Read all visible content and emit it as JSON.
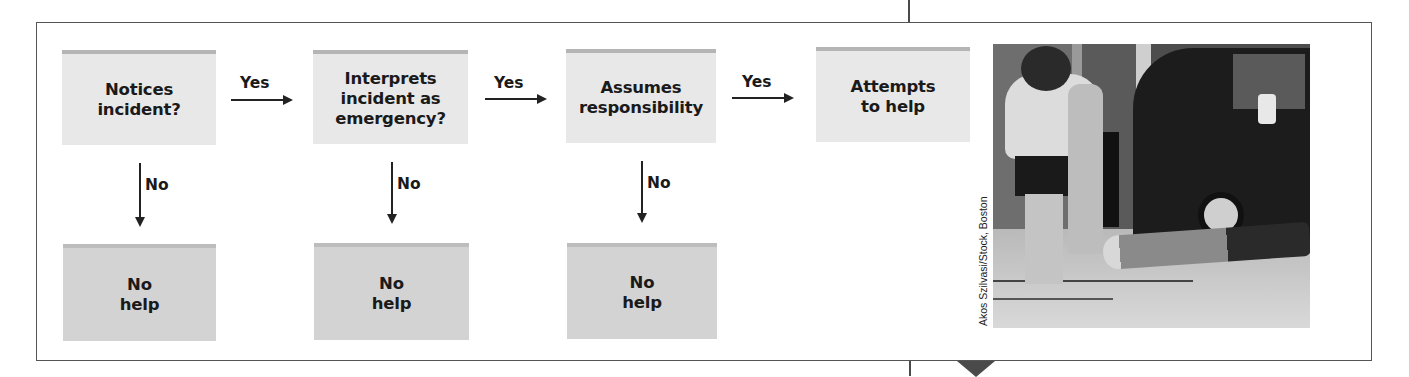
{
  "diagram": {
    "steps": [
      {
        "label": "Notices\nincident?"
      },
      {
        "label": "Interprets\nincident as\nemergency?"
      },
      {
        "label": "Assumes\nresponsibility"
      },
      {
        "label": "Attempts\nto help"
      }
    ],
    "yes_label": "Yes",
    "no_label": "No",
    "outcomes": [
      {
        "label": "No\nhelp"
      },
      {
        "label": "No\nhelp"
      },
      {
        "label": "No\nhelp"
      }
    ]
  },
  "photo": {
    "description": "Pedestrians walking past a person lying on the sidewalk next to a parked van",
    "credit": "Akos Szilvasi/Stock, Boston"
  },
  "colors": {
    "step_fill": "#e8e8e8",
    "step_stripe": "#b5b5b5",
    "outcome_fill": "#d3d3d3",
    "outcome_stripe": "#bdbdbd",
    "arrow": "#222222",
    "frame": "#555555"
  }
}
